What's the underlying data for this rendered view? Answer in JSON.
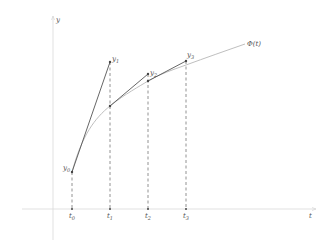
{
  "diagram": {
    "colors": {
      "axis": "#d9d9d9",
      "curve": "#bfbfbf",
      "euler_segment": "#555555",
      "dashed": "#777777",
      "point": "#444444",
      "text": "#555555"
    },
    "axes": {
      "x_label": "t",
      "y_label": "y"
    },
    "curve_label": "Φ(t)",
    "points": [
      {
        "name": "y",
        "sub": "0",
        "label": "y0"
      },
      {
        "name": "y",
        "sub": "1",
        "label": "y1"
      },
      {
        "name": "y",
        "sub": "2",
        "label": "y2"
      },
      {
        "name": "y",
        "sub": "3",
        "label": "y3"
      }
    ],
    "ticks": [
      {
        "name": "t",
        "sub": "0",
        "label": "t0"
      },
      {
        "name": "t",
        "sub": "1",
        "label": "t1"
      },
      {
        "name": "t",
        "sub": "2",
        "label": "t2"
      },
      {
        "name": "t",
        "sub": "3",
        "label": "t3"
      }
    ]
  }
}
